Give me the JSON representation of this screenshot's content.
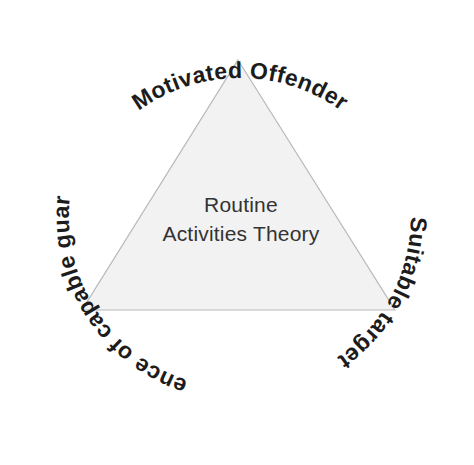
{
  "canvas": {
    "width": 474,
    "height": 465,
    "background": "#ffffff"
  },
  "diagram": {
    "type": "triangle-concept-diagram",
    "title": "Routine Activities Theory"
  },
  "triangle": {
    "fill": "#f2f2f2",
    "stroke": "#b9b9b9",
    "apex": {
      "x": 238,
      "y": 60
    },
    "base_left": {
      "x": 82,
      "y": 310
    },
    "base_right": {
      "x": 395,
      "y": 310
    }
  },
  "center": {
    "line1": "Routine",
    "line2": "Activities Theory",
    "color": "#333333"
  },
  "arc_labels": {
    "color": "#1c1c1c",
    "top": {
      "text": "Motivated Offender",
      "position": "top",
      "reading": "left-to-right-upright"
    },
    "right": {
      "text": "Suitable target",
      "position": "right",
      "reading": "top-to-bottom-clockwise"
    },
    "left": {
      "text": "Absence of capable guardian",
      "position": "left",
      "reading": "bottom-to-top-counterclockwise"
    }
  }
}
